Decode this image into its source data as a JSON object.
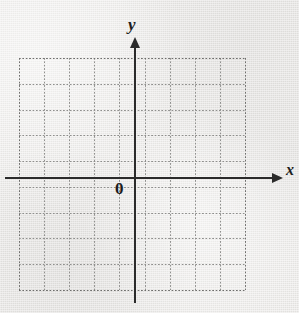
{
  "figure": {
    "kind": "cartesian-coordinate-grid",
    "width": 299,
    "height": 313,
    "background_color": "#e9e8e5",
    "medium": "scanned-textbook-page"
  },
  "labels": {
    "y_axis": "y",
    "x_axis": "x",
    "origin": "0"
  },
  "colors": {
    "axis": "#2b2b2b",
    "grid_dot": "#8f8f8d",
    "grid_edge_dot": "#6e6e6c",
    "text": "#1e1e1e",
    "paper": "#e9e8e5"
  },
  "chart_data": {
    "type": "scatter",
    "title": "",
    "xlabel": "x",
    "ylabel": "y",
    "origin_label": "0",
    "grid": true,
    "grid_style": "dotted",
    "legend": "none",
    "series": [],
    "x": [],
    "values": [],
    "annotations": [],
    "xlim": [
      -4.5,
      4.3
    ],
    "ylim": [
      -4.4,
      4.6
    ],
    "x_tick_count": 10,
    "y_tick_count": 10,
    "tick_labels_shown": false,
    "axis_arrows": [
      "x-positive",
      "y-positive"
    ]
  },
  "geometry": {
    "grid": {
      "left": 19,
      "top": 58,
      "right": 245,
      "bottom": 290,
      "columns": 9,
      "rows": 9,
      "cell_width": 25.11,
      "cell_height": 25.78
    },
    "x_axis": {
      "y": 177,
      "start_x": 5,
      "end_x": 272,
      "arrow_tip_x": 283
    },
    "y_axis": {
      "x": 134,
      "start_y": 48,
      "end_y": 303,
      "arrow_tip_y": 37
    },
    "label_positions": {
      "y": {
        "x": 128,
        "y": 16
      },
      "x": {
        "x": 286,
        "y": 162
      },
      "origin": {
        "x": 115,
        "y": 180
      }
    }
  }
}
